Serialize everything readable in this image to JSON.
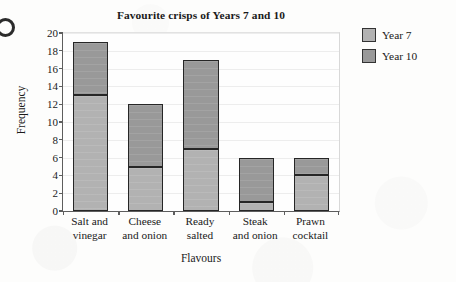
{
  "chart_data": {
    "type": "bar",
    "subtype": "stacked-bar",
    "title": "Favourite crisps of Years 7 and 10",
    "xlabel": "Flavours",
    "ylabel": "Frequency",
    "categories": [
      "Salt and\nvinegar",
      "Cheese\nand onion",
      "Ready\nsalted",
      "Steak\nand onion",
      "Prawn\ncocktail"
    ],
    "series": [
      {
        "name": "Year 7",
        "color": "#b2b2b2",
        "values": [
          13,
          5,
          7,
          1,
          4
        ]
      },
      {
        "name": "Year 10",
        "color": "#999999",
        "values": [
          6,
          7,
          10,
          5,
          2
        ]
      }
    ],
    "totals": [
      19,
      12,
      17,
      6,
      6
    ],
    "ylim": [
      0,
      20
    ],
    "ytick_step": 2,
    "yticks": [
      "0",
      "2",
      "4",
      "6",
      "8",
      "10",
      "12",
      "14",
      "16",
      "18",
      "20"
    ],
    "grid": true,
    "legend_position": "right"
  },
  "legend": {
    "items": [
      {
        "label": "Year 7"
      },
      {
        "label": "Year 10"
      }
    ]
  },
  "question_marker": "9"
}
